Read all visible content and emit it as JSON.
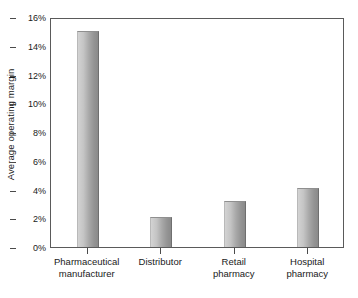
{
  "chart_data": {
    "type": "bar",
    "title": "",
    "subtitle": "",
    "xlabel": "",
    "ylabel": "Average operating margin",
    "categories": [
      "Pharmaceutical manufacturer",
      "Distributor",
      "Retail pharmacy",
      "Hospital pharmacy"
    ],
    "category_lines": [
      [
        "Pharmaceutical",
        "manufacturer"
      ],
      [
        "Distributor"
      ],
      [
        "Retail",
        "pharmacy"
      ],
      [
        "Hospital",
        "pharmacy"
      ]
    ],
    "values": [
      15.0,
      2.1,
      3.2,
      4.1
    ],
    "value_unit": "%",
    "ylim": [
      0,
      16
    ],
    "ytick_step": 2,
    "ytick_labels": [
      "0%",
      "2%",
      "4%",
      "6%",
      "8%",
      "10%",
      "12%",
      "14%",
      "16%"
    ],
    "ytick_values": [
      0,
      2,
      4,
      6,
      8,
      10,
      12,
      14,
      16
    ],
    "grid": false,
    "legend": null,
    "legend_position": "none",
    "series": [
      {
        "name": "Average operating margin",
        "values": [
          15.0,
          2.1,
          3.2,
          4.1
        ]
      }
    ],
    "colors": {
      "bar_light": "#d3d3d3",
      "bar_dark": "#8a8a8a",
      "axis": "#5a5a5a",
      "text": "#1a1a1a",
      "background": "#ffffff"
    }
  }
}
